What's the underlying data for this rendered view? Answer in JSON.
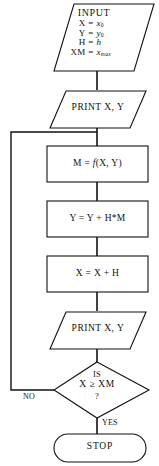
{
  "diagram": {
    "background_color": "#ffffff",
    "stroke_color": "#111111"
  },
  "nodes": {
    "input": {
      "shape": "parallelogram",
      "header": "INPUT",
      "assignments": [
        {
          "lhs": "X",
          "op": "=",
          "rhs_var": "x",
          "rhs_sub": "0"
        },
        {
          "lhs": "Y",
          "op": "=",
          "rhs_var": "y",
          "rhs_sub": "0"
        },
        {
          "lhs": "H",
          "op": "=",
          "rhs_var": "h",
          "rhs_sub": ""
        },
        {
          "lhs": "XM",
          "op": "=",
          "rhs_var": "x",
          "rhs_sub": "max"
        }
      ]
    },
    "print_initial": {
      "shape": "parallelogram",
      "label": "PRINT X, Y"
    },
    "compute_m": {
      "shape": "process",
      "lhs": "M",
      "op": "=",
      "fn": "f",
      "args": "(X, Y)"
    },
    "update_y": {
      "shape": "process",
      "label": "Y  =  Y  +  H*M"
    },
    "update_x": {
      "shape": "process",
      "label": "X  =  X  +  H"
    },
    "print_loop": {
      "shape": "parallelogram",
      "label": "PRINT X, Y"
    },
    "decision": {
      "shape": "diamond",
      "line1": "IS",
      "line2": "X ≥ XM",
      "line3": "?"
    },
    "stop": {
      "shape": "terminator",
      "label": "STOP"
    }
  },
  "edges": {
    "no_label": "NO",
    "yes_label": "YES"
  }
}
